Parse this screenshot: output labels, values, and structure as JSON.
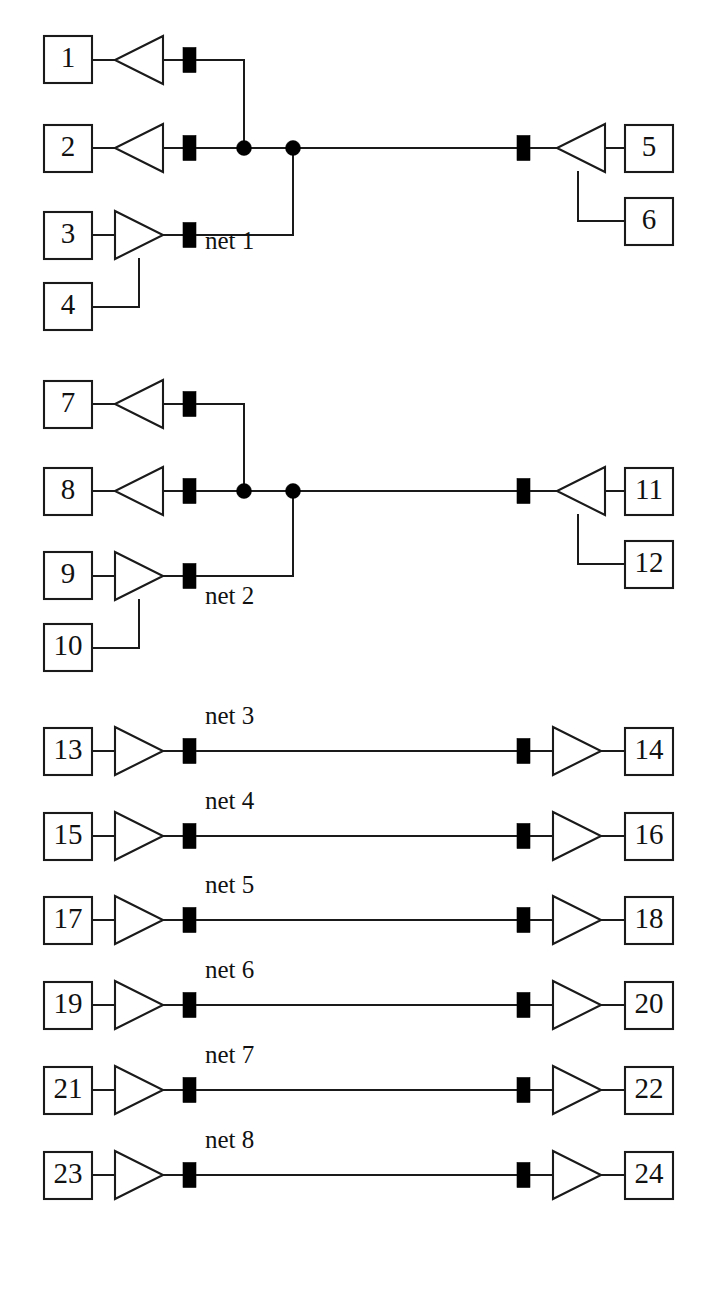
{
  "diagram": {
    "canvas": {
      "width": 711,
      "height": 1296
    },
    "colors": {
      "background": "#ffffff",
      "line": "#1a1a1a",
      "fill_black": "#000000",
      "text": "#111111"
    },
    "geometry": {
      "box_width": 48,
      "box_height": 47,
      "bar_width": 13,
      "bar_height": 25,
      "dot_radius": 7.5,
      "triangle_length": 48,
      "triangle_height": 48
    },
    "groups": [
      {
        "id": "group-net-1",
        "net_label": "net 1",
        "net_label_x": 205,
        "net_label_y": 243,
        "kind": "fanin-fanout",
        "rows": [
          {
            "pin": "1",
            "box_x": 44,
            "box_y": 36,
            "center_y": 60,
            "role": "driver",
            "triangle": "left",
            "has_bar": true,
            "bar_x": 183
          },
          {
            "pin": "2",
            "box_x": 44,
            "box_y": 125,
            "center_y": 148,
            "role": "driver",
            "triangle": "left",
            "has_bar": true,
            "bar_x": 183
          },
          {
            "pin": "3",
            "box_x": 44,
            "box_y": 212,
            "center_y": 235,
            "role": "driver",
            "triangle": "right",
            "has_bar": true,
            "bar_x": 183
          },
          {
            "pin": "4",
            "box_x": 44,
            "box_y": 283,
            "center_y": 307,
            "role": "driver-aux",
            "triangle": "none",
            "has_bar": false,
            "bar_x": 0
          },
          {
            "pin": "5",
            "box_x": 625,
            "box_y": 125,
            "center_y": 148,
            "role": "receiver",
            "triangle": "left",
            "has_bar": true,
            "bar_x": 517
          },
          {
            "pin": "6",
            "box_x": 625,
            "box_y": 198,
            "center_y": 221,
            "role": "receiver-aux",
            "triangle": "none",
            "has_bar": false,
            "bar_x": 0
          }
        ],
        "trunk_y": 148,
        "dot_1_x": 244,
        "dot_2_x": 293
      },
      {
        "id": "group-net-2",
        "net_label": "net 2",
        "net_label_x": 205,
        "net_label_y": 598,
        "kind": "fanin-fanout",
        "rows": [
          {
            "pin": "7",
            "box_x": 44,
            "box_y": 381,
            "center_y": 404,
            "role": "driver",
            "triangle": "left",
            "has_bar": true,
            "bar_x": 183
          },
          {
            "pin": "8",
            "box_x": 44,
            "box_y": 468,
            "center_y": 491,
            "role": "driver",
            "triangle": "left",
            "has_bar": true,
            "bar_x": 183
          },
          {
            "pin": "9",
            "box_x": 44,
            "box_y": 552,
            "center_y": 576,
            "role": "driver",
            "triangle": "right",
            "has_bar": true,
            "bar_x": 183
          },
          {
            "pin": "10",
            "box_x": 44,
            "box_y": 624,
            "center_y": 648,
            "role": "driver-aux",
            "triangle": "none",
            "has_bar": false,
            "bar_x": 0
          },
          {
            "pin": "11",
            "box_x": 625,
            "box_y": 468,
            "center_y": 491,
            "role": "receiver",
            "triangle": "left",
            "has_bar": true,
            "bar_x": 517
          },
          {
            "pin": "12",
            "box_x": 625,
            "box_y": 541,
            "center_y": 564,
            "role": "receiver-aux",
            "triangle": "none",
            "has_bar": false,
            "bar_x": 0
          }
        ],
        "trunk_y": 491,
        "dot_1_x": 244,
        "dot_2_x": 293
      },
      {
        "id": "group-net-3",
        "net_label": "net 3",
        "net_label_x": 205,
        "net_label_y": 718,
        "kind": "point-to-point",
        "trunk_y": 751,
        "left_pin": "13",
        "right_pin": "14",
        "left_box_x": 44,
        "right_box_x": 625,
        "box_y": 728,
        "left_bar_x": 183,
        "right_bar_x": 517
      },
      {
        "id": "group-net-4",
        "net_label": "net 4",
        "net_label_x": 205,
        "net_label_y": 803,
        "kind": "point-to-point",
        "trunk_y": 836,
        "left_pin": "15",
        "right_pin": "16",
        "left_box_x": 44,
        "right_box_x": 625,
        "box_y": 813,
        "left_bar_x": 183,
        "right_bar_x": 517
      },
      {
        "id": "group-net-5",
        "net_label": "net 5",
        "net_label_x": 205,
        "net_label_y": 887,
        "kind": "point-to-point",
        "trunk_y": 920,
        "left_pin": "17",
        "right_pin": "18",
        "left_box_x": 44,
        "right_box_x": 625,
        "box_y": 897,
        "left_bar_x": 183,
        "right_bar_x": 517
      },
      {
        "id": "group-net-6",
        "net_label": "net 6",
        "net_label_x": 205,
        "net_label_y": 972,
        "kind": "point-to-point",
        "trunk_y": 1005,
        "left_pin": "19",
        "right_pin": "20",
        "left_box_x": 44,
        "right_box_x": 625,
        "box_y": 982,
        "left_bar_x": 183,
        "right_bar_x": 517
      },
      {
        "id": "group-net-7",
        "net_label": "net 7",
        "net_label_x": 205,
        "net_label_y": 1057,
        "kind": "point-to-point",
        "trunk_y": 1090,
        "left_pin": "21",
        "right_pin": "22",
        "left_box_x": 44,
        "right_box_x": 625,
        "box_y": 1067,
        "left_bar_x": 183,
        "right_bar_x": 517
      },
      {
        "id": "group-net-8",
        "net_label": "net 8",
        "net_label_x": 205,
        "net_label_y": 1142,
        "kind": "point-to-point",
        "trunk_y": 1175,
        "left_pin": "23",
        "right_pin": "24",
        "left_box_x": 44,
        "right_box_x": 625,
        "box_y": 1152,
        "left_bar_x": 183,
        "right_bar_x": 517
      }
    ],
    "pin_labels": [
      "1",
      "2",
      "3",
      "4",
      "5",
      "6",
      "7",
      "8",
      "9",
      "10",
      "11",
      "12",
      "13",
      "14",
      "15",
      "16",
      "17",
      "18",
      "19",
      "20",
      "21",
      "22",
      "23",
      "24"
    ],
    "net_labels": [
      "net 1",
      "net 2",
      "net 3",
      "net 4",
      "net 5",
      "net 6",
      "net 7",
      "net 8"
    ]
  }
}
